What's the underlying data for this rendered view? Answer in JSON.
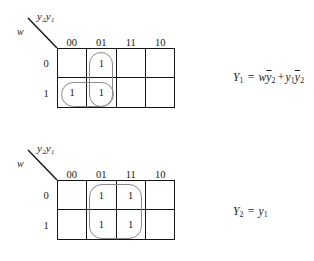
{
  "figure": {
    "maps": [
      {
        "id": "kmap-y1",
        "header": {
          "top_label": "y₂y₁",
          "side_label": "w"
        },
        "column_labels": [
          "00",
          "01",
          "11",
          "10"
        ],
        "row_labels": [
          "0",
          "1"
        ],
        "cells": [
          [
            "",
            "1",
            "",
            ""
          ],
          [
            "1",
            "1",
            "",
            ""
          ]
        ],
        "groups": [
          {
            "name": "group-column-01",
            "col": 1,
            "row": 0,
            "width_cells": 1,
            "height_cells": 2
          },
          {
            "name": "group-row-1-cols-00-01",
            "col": 0,
            "row": 1,
            "width_cells": 2,
            "height_cells": 1
          }
        ],
        "equation": {
          "lhs": "Y",
          "lhs_sub": "1",
          "equals": "=",
          "terms": [
            {
              "vars": [
                {
                  "name": "w",
                  "bar": false,
                  "sub": ""
                },
                {
                  "name": "y",
                  "bar": true,
                  "sub": "2"
                }
              ]
            },
            {
              "vars": [
                {
                  "name": "y",
                  "bar": false,
                  "sub": "1"
                },
                {
                  "name": "y",
                  "bar": true,
                  "sub": "2"
                }
              ]
            }
          ],
          "operator": "+"
        }
      },
      {
        "id": "kmap-y2",
        "header": {
          "top_label": "y₂y₁",
          "side_label": "w"
        },
        "column_labels": [
          "00",
          "01",
          "11",
          "10"
        ],
        "row_labels": [
          "0",
          "1"
        ],
        "cells": [
          [
            "",
            "1",
            "1",
            ""
          ],
          [
            "",
            "1",
            "1",
            ""
          ]
        ],
        "groups": [
          {
            "name": "group-cols-01-11",
            "col": 1,
            "row": 0,
            "width_cells": 2,
            "height_cells": 2
          }
        ],
        "equation": {
          "lhs": "Y",
          "lhs_sub": "2",
          "equals": "=",
          "terms": [
            {
              "vars": [
                {
                  "name": "y",
                  "bar": false,
                  "sub": "1"
                }
              ]
            }
          ],
          "operator": ""
        }
      }
    ],
    "colors": {
      "grid_line": "#151515",
      "group_outline": "#8a8a8a",
      "text": "#1a1a1a",
      "background": "#ffffff"
    }
  }
}
